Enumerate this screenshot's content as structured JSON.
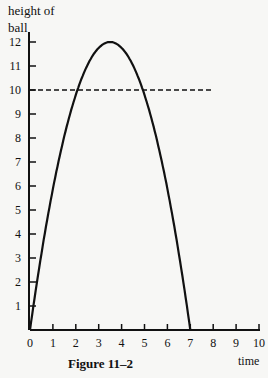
{
  "figure": {
    "caption": "Figure 11–2",
    "y_axis_label_line1": "height of",
    "y_axis_label_line2": "ball",
    "x_axis_label": "time"
  },
  "chart_data": {
    "type": "line",
    "title": "Figure 11–2",
    "xlabel": "time",
    "ylabel": "height of ball",
    "xlim": [
      0,
      10
    ],
    "ylim": [
      0,
      12
    ],
    "x_ticks": [
      0,
      1,
      2,
      3,
      4,
      5,
      6,
      7,
      8,
      9,
      10
    ],
    "y_ticks": [
      1,
      2,
      3,
      4,
      5,
      6,
      7,
      8,
      9,
      10,
      11,
      12
    ],
    "grid": false,
    "series": [
      {
        "name": "height of ball",
        "style": "solid",
        "x": [
          0,
          0.5,
          1,
          1.5,
          2,
          2.5,
          3,
          3.5,
          4,
          4.5,
          5,
          5.5,
          6,
          6.5,
          7
        ],
        "y": [
          0,
          3.18,
          5.88,
          8.08,
          9.8,
          11.02,
          11.76,
          12,
          11.76,
          11.02,
          9.8,
          8.08,
          5.88,
          3.18,
          0
        ]
      },
      {
        "name": "height 10 reference",
        "style": "dashed",
        "x": [
          0,
          8
        ],
        "y": [
          10,
          10
        ]
      }
    ],
    "annotations": [
      "Dashed horizontal line at height 10 intersects curve near t≈1.6 and t≈5.4"
    ]
  }
}
